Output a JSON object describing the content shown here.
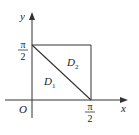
{
  "diagram": {
    "axes": {
      "x_label": "x",
      "y_label": "y",
      "origin_label": "O"
    },
    "ticks": {
      "x_tick": {
        "numerator": "π",
        "denominator": "2"
      },
      "y_tick": {
        "numerator": "π",
        "denominator": "2"
      }
    },
    "regions": {
      "d1": {
        "letter": "D",
        "sub": "1"
      },
      "d2": {
        "letter": "D",
        "sub": "2"
      }
    },
    "colors": {
      "line": "#333333",
      "background": "#ffffff"
    }
  }
}
